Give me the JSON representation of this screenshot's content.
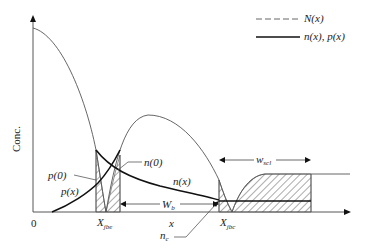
{
  "diagram": {
    "type": "bjt-carrier-concentration-profile",
    "y_axis_label": "Conc.",
    "x_axis_label": "x",
    "origin_label": "0",
    "legend": [
      {
        "style": "dashed",
        "label": "N(x)"
      },
      {
        "style": "solid-heavy",
        "label": "n(x), p(x)"
      }
    ],
    "annotations": {
      "p0": "p(0)",
      "px": "p(x)",
      "n0": "n(0)",
      "nx": "n(x)",
      "wb_main": "W",
      "wb_sub": "b",
      "xjbe_main": "X",
      "xjbe_sub": "jbe",
      "xjbc_main": "X",
      "xjbc_sub": "jbc",
      "nc_main": "n",
      "nc_sub": "c",
      "wscl_main": "w",
      "wscl_sub": "scl"
    },
    "colors": {
      "thin_line": "#555555",
      "heavy_line": "#111111",
      "hatch": "#444444"
    }
  }
}
